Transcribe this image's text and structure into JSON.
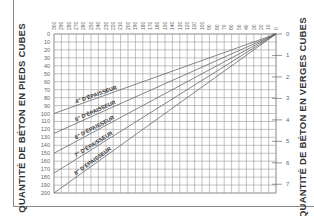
{
  "chart_data": {
    "type": "line",
    "title": "",
    "xlabel": "",
    "ylabel": "QUANTITÉ DE BÉTON EN PIEDS CUBES",
    "ylabel_right": "QUANTITÉ DE BÉTON EN VERGES CUBES",
    "x_ticks": [
      300,
      290,
      280,
      270,
      260,
      250,
      240,
      230,
      220,
      210,
      200,
      190,
      180,
      170,
      160,
      150,
      140,
      130,
      120,
      110,
      100,
      90,
      80,
      70,
      60,
      50,
      40,
      30,
      20,
      10,
      0
    ],
    "xlim": [
      300,
      0
    ],
    "y_ticks_left": [
      0,
      10,
      20,
      30,
      40,
      50,
      60,
      70,
      80,
      90,
      100,
      110,
      120,
      130,
      140,
      150,
      160,
      170,
      180,
      190,
      200
    ],
    "ylim_left": [
      0,
      200
    ],
    "y_ticks_right": [
      0,
      1,
      2,
      3,
      4,
      5,
      6,
      7
    ],
    "grid": true,
    "series": [
      {
        "name": "4\" D'ÉPAISSEUR",
        "x": [
          0,
          300
        ],
        "y": [
          0,
          100
        ]
      },
      {
        "name": "5\" D'ÉPAISSEUR",
        "x": [
          0,
          300
        ],
        "y": [
          0,
          125
        ]
      },
      {
        "name": "6\" D'ÉPAISSEUR",
        "x": [
          0,
          300
        ],
        "y": [
          0,
          150
        ]
      },
      {
        "name": "7\" D'ÉPAISSEUR",
        "x": [
          0,
          300
        ],
        "y": [
          0,
          175
        ]
      },
      {
        "name": "8\" D'ÉPAISSEUR",
        "x": [
          0,
          300
        ],
        "y": [
          0,
          200
        ]
      }
    ]
  },
  "labels": {
    "left_title": "QUANTITÉ DE BÉTON EN PIEDS CUBES",
    "right_title": "QUANTITÉ DE BÉTON EN VERGES CUBES"
  },
  "colors": {
    "grid": "#9a9a9a",
    "line": "#555555",
    "text": "#333333",
    "tick_text": "#666666"
  }
}
